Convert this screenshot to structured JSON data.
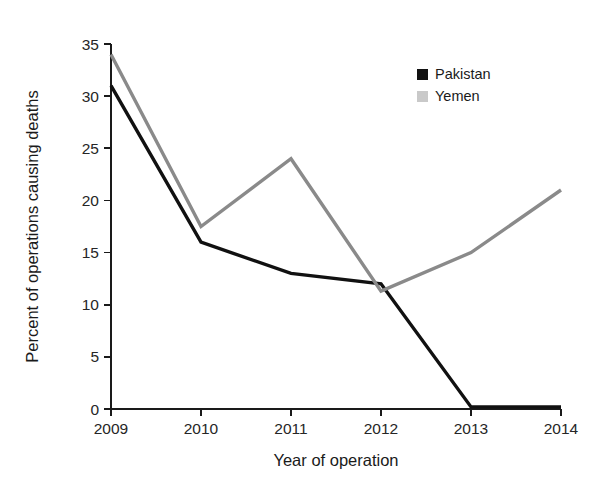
{
  "chart_data": {
    "type": "line",
    "title": "",
    "xlabel": "Year of operation",
    "ylabel": "Percent of operations causing deaths",
    "categories": [
      "2009",
      "2010",
      "2011",
      "2012",
      "2013",
      "2014"
    ],
    "x": [
      2009,
      2010,
      2011,
      2012,
      2013,
      2014
    ],
    "xlim": [
      2009,
      2014
    ],
    "ylim": [
      0,
      35
    ],
    "yticks": [
      0,
      5,
      10,
      15,
      20,
      25,
      30,
      35
    ],
    "ytick_labels": [
      "0",
      "5",
      "10",
      "15",
      "20",
      "25",
      "30",
      "35"
    ],
    "xticks": [
      2009,
      2010,
      2011,
      2012,
      2013,
      2014
    ],
    "xtick_labels": [
      "2009",
      "2010",
      "2011",
      "2012",
      "2013",
      "2014"
    ],
    "grid": false,
    "legend_position": "top-right",
    "series": [
      {
        "name": "Pakistan",
        "color": "#111111",
        "marker": "square",
        "line_width": 3.4,
        "values": [
          31,
          16,
          13,
          12,
          0.2,
          0.2
        ]
      },
      {
        "name": "Yemen",
        "color": "#8a8a8a",
        "marker": "square",
        "line_width": 3.4,
        "values": [
          34,
          17.5,
          24,
          11.3,
          15,
          21
        ]
      }
    ]
  },
  "legend": {
    "items": [
      {
        "label": "Pakistan",
        "color": "#111111"
      },
      {
        "label": "Yemen",
        "color": "#c9c9c9"
      }
    ]
  },
  "axes": {
    "y_title": "Percent of operations causing deaths",
    "x_title": "Year of operation"
  }
}
